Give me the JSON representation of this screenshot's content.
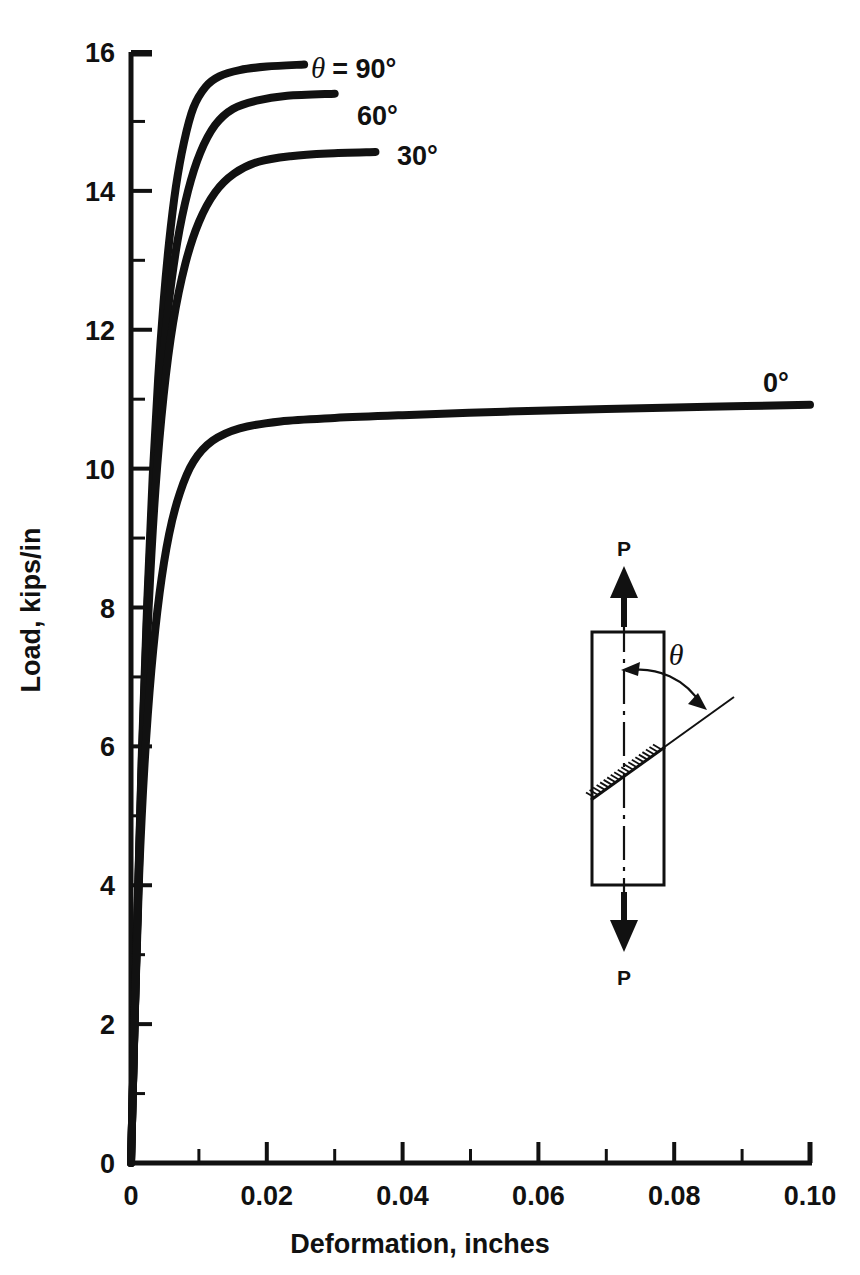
{
  "chart_data": {
    "type": "line",
    "title": "",
    "xlabel": "Deformation, inches",
    "ylabel": "Load, kips/in",
    "xlim": [
      0,
      0.1
    ],
    "ylim": [
      0,
      16
    ],
    "grid": false,
    "legend_position": "inline-end-of-curve",
    "x_ticks": [
      0,
      0.02,
      0.04,
      0.06,
      0.08,
      0.1
    ],
    "x_tick_labels": [
      "0",
      "0.02",
      "0.04",
      "0.06",
      "0.08",
      "0.10"
    ],
    "x_minor_ticks": [
      0.01,
      0.03,
      0.05,
      0.07,
      0.09
    ],
    "y_ticks": [
      0,
      2,
      4,
      6,
      8,
      10,
      12,
      14,
      16
    ],
    "y_tick_labels": [
      "0",
      "2",
      "4",
      "6",
      "8",
      "10",
      "12",
      "14",
      "16"
    ],
    "y_minor_ticks": [
      1,
      3,
      5,
      7,
      9,
      11,
      13,
      15
    ],
    "series": [
      {
        "name": "theta = 90 degrees",
        "label": "= 90°",
        "label_prefix_symbol": "θ",
        "points": [
          [
            0.0,
            0.0
          ],
          [
            0.0008,
            3.1
          ],
          [
            0.0016,
            5.9
          ],
          [
            0.0024,
            8.1
          ],
          [
            0.0032,
            9.9
          ],
          [
            0.004,
            11.3
          ],
          [
            0.0048,
            12.4
          ],
          [
            0.0056,
            13.25
          ],
          [
            0.0066,
            14.05
          ],
          [
            0.0078,
            14.7
          ],
          [
            0.0092,
            15.2
          ],
          [
            0.011,
            15.5
          ],
          [
            0.013,
            15.65
          ],
          [
            0.016,
            15.74
          ],
          [
            0.02,
            15.79
          ],
          [
            0.0255,
            15.82
          ]
        ]
      },
      {
        "name": "theta = 60 degrees",
        "label": "60°",
        "points": [
          [
            0.0,
            0.0
          ],
          [
            0.0008,
            3.05
          ],
          [
            0.0016,
            5.8
          ],
          [
            0.0024,
            7.95
          ],
          [
            0.0032,
            9.6
          ],
          [
            0.0042,
            11.05
          ],
          [
            0.0054,
            12.25
          ],
          [
            0.0068,
            13.25
          ],
          [
            0.0084,
            14.0
          ],
          [
            0.0102,
            14.55
          ],
          [
            0.0124,
            14.95
          ],
          [
            0.015,
            15.18
          ],
          [
            0.0185,
            15.3
          ],
          [
            0.023,
            15.37
          ],
          [
            0.03,
            15.4
          ]
        ]
      },
      {
        "name": "theta = 30 degrees",
        "label": "30°",
        "points": [
          [
            0.0,
            0.0
          ],
          [
            0.0008,
            3.0
          ],
          [
            0.0016,
            5.65
          ],
          [
            0.0026,
            8.0
          ],
          [
            0.0036,
            9.7
          ],
          [
            0.0048,
            11.05
          ],
          [
            0.0062,
            12.1
          ],
          [
            0.008,
            12.95
          ],
          [
            0.01,
            13.55
          ],
          [
            0.0124,
            13.98
          ],
          [
            0.0152,
            14.25
          ],
          [
            0.0188,
            14.42
          ],
          [
            0.0235,
            14.5
          ],
          [
            0.029,
            14.54
          ],
          [
            0.036,
            14.56
          ]
        ]
      },
      {
        "name": "theta = 0 degrees",
        "label": "0°",
        "points": [
          [
            0.0,
            0.0
          ],
          [
            0.0006,
            2.3
          ],
          [
            0.0012,
            4.15
          ],
          [
            0.002,
            5.75
          ],
          [
            0.003,
            7.1
          ],
          [
            0.0042,
            8.2
          ],
          [
            0.0056,
            9.05
          ],
          [
            0.0072,
            9.65
          ],
          [
            0.0092,
            10.1
          ],
          [
            0.012,
            10.4
          ],
          [
            0.016,
            10.58
          ],
          [
            0.022,
            10.68
          ],
          [
            0.03,
            10.73
          ],
          [
            0.04,
            10.77
          ],
          [
            0.055,
            10.82
          ],
          [
            0.07,
            10.86
          ],
          [
            0.085,
            10.89
          ],
          [
            0.1,
            10.92
          ]
        ]
      }
    ]
  },
  "inset": {
    "name": "specimen-diagram",
    "load_label_top": "P",
    "load_label_bottom": "P",
    "angle_label": "θ"
  }
}
